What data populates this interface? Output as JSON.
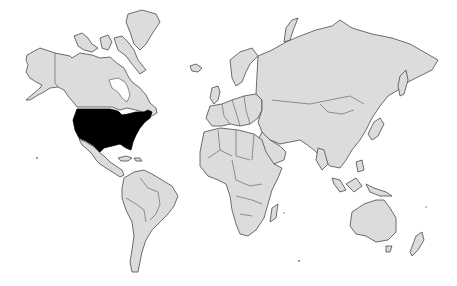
{
  "map": {
    "type": "world-choropleth",
    "projection": "mercator",
    "background_color": "#ffffff",
    "land_color": "#dcdcdc",
    "border_color": "#4a4a4a",
    "highlight_color": "#000000",
    "highlighted_regions": [
      {
        "id": "usa",
        "name": "United States"
      }
    ],
    "regions": [
      {
        "id": "north-america",
        "name": "North America"
      },
      {
        "id": "greenland",
        "name": "Greenland"
      },
      {
        "id": "central-america",
        "name": "Central America & Caribbean"
      },
      {
        "id": "south-america",
        "name": "South America"
      },
      {
        "id": "europe",
        "name": "Europe"
      },
      {
        "id": "africa",
        "name": "Africa"
      },
      {
        "id": "asia",
        "name": "Asia"
      },
      {
        "id": "oceania",
        "name": "Oceania"
      }
    ]
  }
}
